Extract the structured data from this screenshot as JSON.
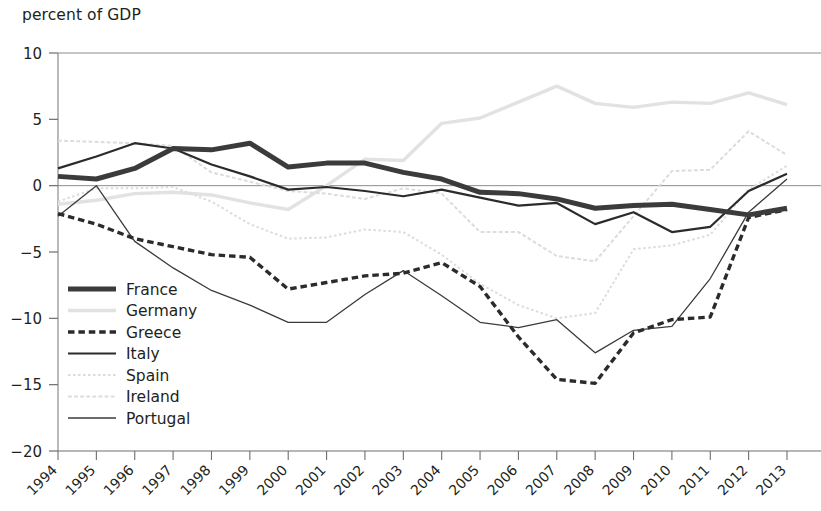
{
  "chart_data": {
    "type": "line",
    "title": "",
    "ylabel": "percent of GDP",
    "xlabel": "",
    "ylim": [
      -20,
      10
    ],
    "yticks": [
      10,
      5,
      0,
      -5,
      -10,
      -15,
      -20
    ],
    "ytick_labels": [
      "10",
      "5",
      "0",
      "−5",
      "−10",
      "−15",
      "−20"
    ],
    "grid": false,
    "zero_line": true,
    "legend_position": "lower-left inside plot",
    "x": [
      1994,
      1995,
      1996,
      1997,
      1998,
      1999,
      2000,
      2001,
      2002,
      2003,
      2004,
      2005,
      2006,
      2007,
      2008,
      2009,
      2010,
      2011,
      2012,
      2013
    ],
    "xtick_labels": [
      "1994",
      "1995",
      "1996",
      "1997",
      "1998",
      "1999",
      "2000",
      "2001",
      "2002",
      "2003",
      "2004",
      "2005",
      "2006",
      "2007",
      "2008",
      "2009",
      "2010",
      "2011",
      "2012",
      "2013"
    ],
    "series": [
      {
        "name": "France",
        "style": "solid",
        "width": 5.0,
        "color": "#3b3b3b",
        "values": [
          0.7,
          0.5,
          1.3,
          2.8,
          2.7,
          3.2,
          1.4,
          1.7,
          1.7,
          1.0,
          0.5,
          -0.5,
          -0.6,
          -1.0,
          -1.7,
          -1.5,
          -1.4,
          -1.8,
          -2.2,
          -1.7
        ]
      },
      {
        "name": "Germany",
        "style": "solid",
        "width": 3.4,
        "color": "#e2e2e2",
        "values": [
          -1.4,
          -1.1,
          -0.6,
          -0.5,
          -0.7,
          -1.3,
          -1.8,
          0.0,
          2.0,
          1.9,
          4.7,
          5.1,
          6.3,
          7.5,
          6.2,
          5.9,
          6.3,
          6.2,
          7.0,
          6.1
        ]
      },
      {
        "name": "Greece",
        "style": "dashed",
        "width": 3.4,
        "color": "#2b2b2b",
        "values": [
          -2.1,
          -2.9,
          -4.0,
          -4.6,
          -5.2,
          -5.4,
          -7.8,
          -7.3,
          -6.8,
          -6.6,
          -5.8,
          -7.6,
          -11.4,
          -14.6,
          -14.9,
          -11.1,
          -10.1,
          -9.9,
          -2.4,
          -1.8
        ]
      },
      {
        "name": "Italy",
        "style": "solid",
        "width": 2.2,
        "color": "#2b2b2b",
        "values": [
          1.3,
          2.2,
          3.2,
          2.8,
          1.6,
          0.7,
          -0.3,
          -0.1,
          -0.4,
          -0.8,
          -0.3,
          -0.9,
          -1.5,
          -1.3,
          -2.9,
          -2.0,
          -3.5,
          -3.1,
          -0.4,
          0.9
        ]
      },
      {
        "name": "Spain",
        "style": "dotted",
        "width": 2.0,
        "color": "#dcdcdc",
        "values": [
          -1.2,
          -0.2,
          -0.2,
          -0.1,
          -1.2,
          -2.9,
          -4.0,
          -3.9,
          -3.3,
          -3.5,
          -5.2,
          -7.4,
          -9.0,
          -10.0,
          -9.6,
          -4.8,
          -4.5,
          -3.7,
          -0.3,
          1.5
        ]
      },
      {
        "name": "Ireland",
        "style": "dashed",
        "width": 2.0,
        "color": "#dcdcdc",
        "values": [
          3.4,
          3.3,
          3.2,
          3.0,
          1.0,
          0.3,
          -0.4,
          -0.6,
          -1.0,
          -0.2,
          -0.6,
          -3.5,
          -3.5,
          -5.3,
          -5.7,
          -2.3,
          1.1,
          1.2,
          4.1,
          2.3
        ]
      },
      {
        "name": "Portugal",
        "style": "solid",
        "width": 1.3,
        "color": "#3b3b3b",
        "values": [
          -2.3,
          0.0,
          -4.2,
          -6.2,
          -7.9,
          -9.0,
          -10.3,
          -10.3,
          -8.2,
          -6.4,
          -8.3,
          -10.3,
          -10.7,
          -10.1,
          -12.6,
          -10.9,
          -10.6,
          -7.0,
          -2.0,
          0.5
        ]
      }
    ],
    "legend": [
      {
        "label": "France"
      },
      {
        "label": "Germany"
      },
      {
        "label": "Greece"
      },
      {
        "label": "Italy"
      },
      {
        "label": "Spain"
      },
      {
        "label": "Ireland"
      },
      {
        "label": "Portugal"
      }
    ]
  },
  "plot_geometry": {
    "left": 58,
    "right": 787,
    "top": 53,
    "bottom": 451,
    "legend_x": 68,
    "legend_y": 289,
    "legend_row_height": 21.5
  }
}
